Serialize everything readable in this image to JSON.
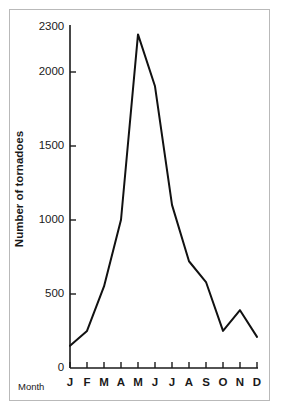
{
  "chart_data": {
    "type": "line",
    "title": "",
    "xlabel": "Month",
    "ylabel": "Number of tornadoes",
    "categories": [
      "J",
      "F",
      "M",
      "A",
      "M",
      "J",
      "J",
      "A",
      "S",
      "O",
      "N",
      "D"
    ],
    "category_full_names": [
      "January",
      "February",
      "March",
      "April",
      "May",
      "June",
      "July",
      "August",
      "September",
      "October",
      "November",
      "December"
    ],
    "values": [
      150,
      250,
      550,
      1000,
      2250,
      1900,
      1100,
      720,
      580,
      250,
      390,
      210
    ],
    "series": [
      {
        "name": "Number of tornadoes",
        "values": [
          150,
          250,
          550,
          1000,
          2250,
          1900,
          1100,
          720,
          580,
          250,
          390,
          210
        ]
      }
    ],
    "ylim": [
      0,
      2300
    ],
    "yticks": [
      0,
      500,
      1000,
      1500,
      2000,
      2300
    ],
    "ytick_labels": [
      "0",
      "500",
      "1000",
      "1500",
      "2000",
      "2300"
    ],
    "xtick_labels": [
      "J",
      "F",
      "M",
      "A",
      "M",
      "J",
      "J",
      "A",
      "S",
      "O",
      "N",
      "D"
    ],
    "grid": false,
    "legend": false,
    "legend_position": "none",
    "line_color": "#111111",
    "axis_color": "#1a1a1a",
    "background_color": "#ffffff",
    "border_color": "#b9b9b9"
  },
  "figure": {
    "y_axis_title": "Number of tornadoes",
    "x_axis_title": "Month"
  }
}
